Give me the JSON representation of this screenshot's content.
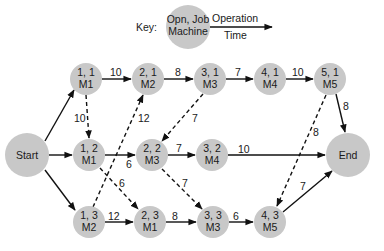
{
  "key": {
    "label": "Key:",
    "node_line1": "Opn, Job",
    "node_line2": "Machine",
    "edge_top": "Operation",
    "edge_bottom": "Time"
  },
  "nodes": {
    "start": {
      "label": "Start"
    },
    "end": {
      "label": "End"
    },
    "n11": {
      "l1": "1, 1",
      "l2": "M1"
    },
    "n21": {
      "l1": "2, 1",
      "l2": "M2"
    },
    "n31": {
      "l1": "3, 1",
      "l2": "M3"
    },
    "n41": {
      "l1": "4, 1",
      "l2": "M4"
    },
    "n51": {
      "l1": "5, 1",
      "l2": "M5"
    },
    "n12": {
      "l1": "1, 2",
      "l2": "M1"
    },
    "n22": {
      "l1": "2, 2",
      "l2": "M3"
    },
    "n32": {
      "l1": "3, 2",
      "l2": "M4"
    },
    "n13": {
      "l1": "1, 3",
      "l2": "M2"
    },
    "n23": {
      "l1": "2, 3",
      "l2": "M1"
    },
    "n33": {
      "l1": "3, 3",
      "l2": "M3"
    },
    "n43": {
      "l1": "4, 3",
      "l2": "M5"
    }
  },
  "edges": {
    "e11_21": "10",
    "e21_31": "8",
    "e31_41": "7",
    "e41_51": "10",
    "e51_end": "8",
    "e11_12": "10",
    "e13_21": "12",
    "e31_22": "7",
    "e12_22": "6",
    "e22_32": "7",
    "e32_end": "10",
    "e12_23": "6",
    "e22_33": "7",
    "e51_43": "8",
    "e13_23": "12",
    "e23_33": "8",
    "e33_43": "6",
    "e43_end": "7"
  }
}
